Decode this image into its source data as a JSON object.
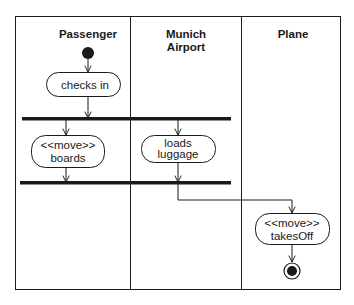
{
  "diagram": {
    "type": "UML activity diagram with swimlanes",
    "lanes": [
      {
        "id": "passenger",
        "title_lines": [
          "Passenger"
        ]
      },
      {
        "id": "munich_airport",
        "title_lines": [
          "Munich",
          "Airport"
        ]
      },
      {
        "id": "plane",
        "title_lines": [
          "Plane"
        ]
      }
    ],
    "activities": [
      {
        "id": "checks_in",
        "lane": "passenger",
        "lines": [
          "checks in"
        ]
      },
      {
        "id": "boards",
        "lane": "passenger",
        "lines": [
          "<<move>>",
          "boards"
        ]
      },
      {
        "id": "loads_luggage",
        "lane": "munich_airport",
        "lines": [
          "loads",
          "luggage"
        ]
      },
      {
        "id": "takes_off",
        "lane": "plane",
        "lines": [
          "<<move>>",
          "takesOff"
        ]
      }
    ],
    "nodes": {
      "initial": {
        "lane": "passenger"
      },
      "fork": {
        "spans": [
          "passenger",
          "munich_airport"
        ]
      },
      "join": {
        "spans": [
          "passenger",
          "munich_airport"
        ]
      },
      "final": {
        "lane": "plane"
      }
    },
    "flows": [
      {
        "from": "initial",
        "to": "checks_in"
      },
      {
        "from": "checks_in",
        "to": "fork"
      },
      {
        "from": "fork",
        "to": "boards"
      },
      {
        "from": "fork",
        "to": "loads_luggage"
      },
      {
        "from": "boards",
        "to": "join"
      },
      {
        "from": "loads_luggage",
        "to": "join"
      },
      {
        "from": "join",
        "to": "takes_off"
      },
      {
        "from": "takes_off",
        "to": "final"
      }
    ],
    "colors": {
      "stroke": "#1a1a1a",
      "background": "#ffffff"
    }
  }
}
